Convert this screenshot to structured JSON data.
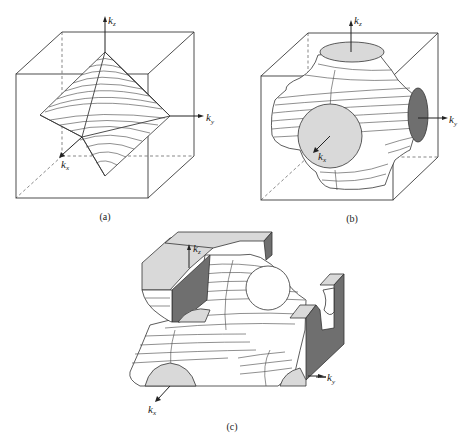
{
  "figure": {
    "panels": [
      {
        "id": "a",
        "caption": "(a)",
        "description": "Octahedral constant-energy surface inside a cubic Brillouin zone box",
        "axes": {
          "kz": "k",
          "kz_sub": "z",
          "ky": "k",
          "ky_sub": "y",
          "kx": "k",
          "kx_sub": "x"
        }
      },
      {
        "id": "b",
        "caption": "(b)",
        "description": "Fermi surface with necks touching cube faces (filled contact discs)",
        "axes": {
          "kz": "k",
          "kz_sub": "z",
          "ky": "k",
          "ky_sub": "y",
          "kx": "k",
          "kx_sub": "x"
        }
      },
      {
        "id": "c",
        "caption": "(c)",
        "description": "Cutaway view of periodic open Fermi surface across several zones",
        "axes": {
          "kz": "k",
          "kz_sub": "z",
          "ky": "k",
          "ky_sub": "y",
          "kx": "k",
          "kx_sub": "x"
        }
      }
    ],
    "colors": {
      "line": "#3a3a3a",
      "light_fill": "#d9d9d9",
      "dark_fill": "#6f6f6f",
      "background": "#ffffff"
    }
  }
}
